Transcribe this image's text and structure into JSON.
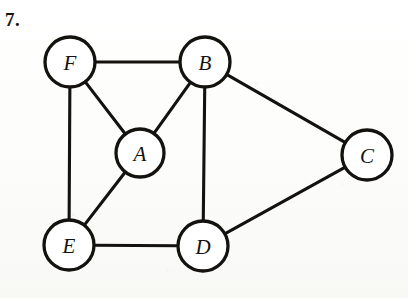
{
  "page": {
    "problem_number": "7.",
    "background_color": "#fdfdfb",
    "ink_color": "#14120e",
    "node_fill_color": "#ffffff"
  },
  "chart_data": {
    "type": "diagram",
    "diagram_kind": "undirected-graph",
    "title": "",
    "xlabel": "",
    "ylabel": "",
    "grid": false,
    "legend": null,
    "nodes": [
      {
        "id": "F",
        "label": "F",
        "x": 70,
        "y": 62,
        "r": 25
      },
      {
        "id": "B",
        "label": "B",
        "x": 205,
        "y": 62,
        "r": 25
      },
      {
        "id": "A",
        "label": "A",
        "x": 140,
        "y": 153,
        "r": 24
      },
      {
        "id": "C",
        "label": "C",
        "x": 367,
        "y": 155,
        "r": 25
      },
      {
        "id": "E",
        "label": "E",
        "x": 69,
        "y": 245,
        "r": 25
      },
      {
        "id": "D",
        "label": "D",
        "x": 203,
        "y": 246,
        "r": 25
      }
    ],
    "edges": [
      {
        "source": "F",
        "target": "B"
      },
      {
        "source": "F",
        "target": "A"
      },
      {
        "source": "F",
        "target": "E"
      },
      {
        "source": "A",
        "target": "B"
      },
      {
        "source": "A",
        "target": "E"
      },
      {
        "source": "B",
        "target": "D"
      },
      {
        "source": "B",
        "target": "C"
      },
      {
        "source": "E",
        "target": "D"
      },
      {
        "source": "D",
        "target": "C"
      }
    ],
    "degrees": {
      "A": 3,
      "B": 4,
      "C": 2,
      "D": 3,
      "E": 3,
      "F": 3
    },
    "node_count": 6,
    "edge_count": 9
  }
}
